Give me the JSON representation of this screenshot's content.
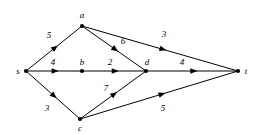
{
  "figure": {
    "kind": "directed-weighted-graph",
    "background_color": "#ffffff",
    "stroke_color": "#000000",
    "text_color": "#000000"
  },
  "nodes": [
    {
      "id": "s",
      "label": "s",
      "x": 26,
      "y": 71,
      "label_x": 18,
      "label_y": 71
    },
    {
      "id": "a",
      "label": "a",
      "x": 82,
      "y": 26,
      "label_x": 82,
      "label_y": 15
    },
    {
      "id": "b",
      "label": "b",
      "x": 82,
      "y": 71,
      "label_x": 82,
      "label_y": 62
    },
    {
      "id": "c",
      "label": "c",
      "x": 80,
      "y": 119,
      "label_x": 80,
      "label_y": 128
    },
    {
      "id": "d",
      "label": "d",
      "x": 146,
      "y": 71,
      "label_x": 147,
      "label_y": 62
    },
    {
      "id": "t",
      "label": "t",
      "x": 238,
      "y": 71,
      "label_x": 246,
      "label_y": 71
    }
  ],
  "edges": [
    {
      "from": "s",
      "to": "a",
      "weight": "5",
      "label_x": 49,
      "label_y": 35
    },
    {
      "from": "s",
      "to": "b",
      "weight": "4",
      "label_x": 53,
      "label_y": 62
    },
    {
      "from": "s",
      "to": "c",
      "weight": "3",
      "label_x": 47,
      "label_y": 108
    },
    {
      "from": "a",
      "to": "d",
      "weight": "6",
      "label_x": 123,
      "label_y": 41
    },
    {
      "from": "a",
      "to": "t",
      "weight": "3",
      "label_x": 164,
      "label_y": 34
    },
    {
      "from": "b",
      "to": "d",
      "weight": "2",
      "label_x": 110,
      "label_y": 62
    },
    {
      "from": "c",
      "to": "d",
      "weight": "7",
      "label_x": 106,
      "label_y": 88
    },
    {
      "from": "c",
      "to": "t",
      "weight": "5",
      "label_x": 163,
      "label_y": 108
    },
    {
      "from": "d",
      "to": "t",
      "weight": "4",
      "label_x": 182,
      "label_y": 62
    }
  ]
}
